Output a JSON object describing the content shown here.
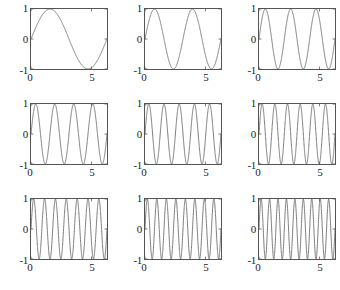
{
  "figure": {
    "kind": "subplot-grid",
    "rows": 3,
    "columns": 3,
    "background_color": "#ffffff",
    "axis_color": "#555555",
    "curve_color": "#6d6d6d"
  },
  "axis": {
    "y_ticks": [
      "1",
      "0",
      "-1"
    ],
    "x_ticks": [
      "0",
      "5"
    ],
    "y_tick_values": [
      1,
      0,
      -1
    ],
    "x_tick_values": [
      0,
      5
    ],
    "xlim": [
      0,
      6.2832
    ],
    "ylim": [
      -1,
      1
    ]
  },
  "chart_data": [
    {
      "type": "line",
      "title": "",
      "xlabel": "",
      "ylabel": "",
      "xlim": [
        0,
        6.2832
      ],
      "ylim": [
        -1,
        1
      ],
      "xticks": [
        0,
        5
      ],
      "xticklabels": [
        "0",
        "5"
      ],
      "yticks": [
        -1,
        0,
        1
      ],
      "yticklabels": [
        "-1",
        "0",
        "1"
      ],
      "grid": false,
      "legend": null,
      "series": [
        {
          "name": "sin(1x)",
          "frequency": 1,
          "expression": "sin(1*x)",
          "amplitude": 1,
          "periods_shown": 1
        }
      ]
    },
    {
      "type": "line",
      "title": "",
      "xlabel": "",
      "ylabel": "",
      "xlim": [
        0,
        6.2832
      ],
      "ylim": [
        -1,
        1
      ],
      "xticks": [
        0,
        5
      ],
      "xticklabels": [
        "0",
        "5"
      ],
      "yticks": [
        -1,
        0,
        1
      ],
      "yticklabels": [
        "-1",
        "0",
        "1"
      ],
      "grid": false,
      "legend": null,
      "series": [
        {
          "name": "sin(2x)",
          "frequency": 2,
          "expression": "sin(2*x)",
          "amplitude": 1,
          "periods_shown": 2
        }
      ]
    },
    {
      "type": "line",
      "title": "",
      "xlabel": "",
      "ylabel": "",
      "xlim": [
        0,
        6.2832
      ],
      "ylim": [
        -1,
        1
      ],
      "xticks": [
        0,
        5
      ],
      "xticklabels": [
        "0",
        "5"
      ],
      "yticks": [
        -1,
        0,
        1
      ],
      "yticklabels": [
        "-1",
        "0",
        "1"
      ],
      "grid": false,
      "legend": null,
      "series": [
        {
          "name": "sin(3x)",
          "frequency": 3,
          "expression": "sin(3*x)",
          "amplitude": 1,
          "periods_shown": 3
        }
      ]
    },
    {
      "type": "line",
      "title": "",
      "xlabel": "",
      "ylabel": "",
      "xlim": [
        0,
        6.2832
      ],
      "ylim": [
        -1,
        1
      ],
      "xticks": [
        0,
        5
      ],
      "xticklabels": [
        "0",
        "5"
      ],
      "yticks": [
        -1,
        0,
        1
      ],
      "yticklabels": [
        "-1",
        "0",
        "1"
      ],
      "grid": false,
      "legend": null,
      "series": [
        {
          "name": "sin(4x)",
          "frequency": 4,
          "expression": "sin(4*x)",
          "amplitude": 1,
          "periods_shown": 4
        }
      ]
    },
    {
      "type": "line",
      "title": "",
      "xlabel": "",
      "ylabel": "",
      "xlim": [
        0,
        6.2832
      ],
      "ylim": [
        -1,
        1
      ],
      "xticks": [
        0,
        5
      ],
      "xticklabels": [
        "0",
        "5"
      ],
      "yticks": [
        -1,
        0,
        1
      ],
      "yticklabels": [
        "-1",
        "0",
        "1"
      ],
      "grid": false,
      "legend": null,
      "series": [
        {
          "name": "sin(5x)",
          "frequency": 5,
          "expression": "sin(5*x)",
          "amplitude": 1,
          "periods_shown": 5
        }
      ]
    },
    {
      "type": "line",
      "title": "",
      "xlabel": "",
      "ylabel": "",
      "xlim": [
        0,
        6.2832
      ],
      "ylim": [
        -1,
        1
      ],
      "xticks": [
        0,
        5
      ],
      "xticklabels": [
        "0",
        "5"
      ],
      "yticks": [
        -1,
        0,
        1
      ],
      "yticklabels": [
        "-1",
        "0",
        "1"
      ],
      "grid": false,
      "legend": null,
      "series": [
        {
          "name": "sin(6x)",
          "frequency": 6,
          "expression": "sin(6*x)",
          "amplitude": 1,
          "periods_shown": 6
        }
      ]
    },
    {
      "type": "line",
      "title": "",
      "xlabel": "",
      "ylabel": "",
      "xlim": [
        0,
        6.2832
      ],
      "ylim": [
        -1,
        1
      ],
      "xticks": [
        0,
        5
      ],
      "xticklabels": [
        "0",
        "5"
      ],
      "yticks": [
        -1,
        0,
        1
      ],
      "yticklabels": [
        "-1",
        "0",
        "1"
      ],
      "grid": false,
      "legend": null,
      "series": [
        {
          "name": "sin(7x)",
          "frequency": 7,
          "expression": "sin(7*x)",
          "amplitude": 1,
          "periods_shown": 7
        }
      ]
    },
    {
      "type": "line",
      "title": "",
      "xlabel": "",
      "ylabel": "",
      "xlim": [
        0,
        6.2832
      ],
      "ylim": [
        -1,
        1
      ],
      "xticks": [
        0,
        5
      ],
      "xticklabels": [
        "0",
        "5"
      ],
      "yticks": [
        -1,
        0,
        1
      ],
      "yticklabels": [
        "-1",
        "0",
        "1"
      ],
      "grid": false,
      "legend": null,
      "series": [
        {
          "name": "sin(8x)",
          "frequency": 8,
          "expression": "sin(8*x)",
          "amplitude": 1,
          "periods_shown": 8
        }
      ]
    },
    {
      "type": "line",
      "title": "",
      "xlabel": "",
      "ylabel": "",
      "xlim": [
        0,
        6.2832
      ],
      "ylim": [
        -1,
        1
      ],
      "xticks": [
        0,
        5
      ],
      "xticklabels": [
        "0",
        "5"
      ],
      "yticks": [
        -1,
        0,
        1
      ],
      "yticklabels": [
        "-1",
        "0",
        "1"
      ],
      "grid": false,
      "legend": null,
      "series": [
        {
          "name": "sin(9x)",
          "frequency": 9,
          "expression": "sin(9*x)",
          "amplitude": 1,
          "periods_shown": 9
        }
      ]
    }
  ]
}
